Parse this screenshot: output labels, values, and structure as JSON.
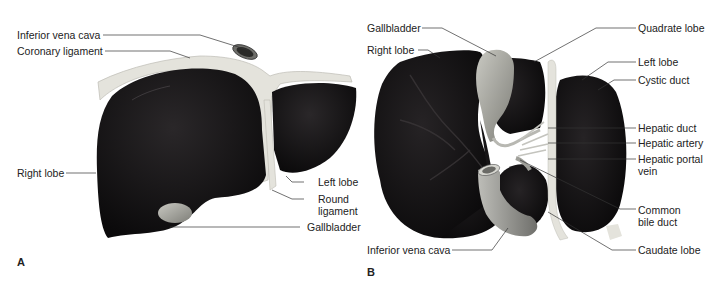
{
  "figure": {
    "panels": [
      {
        "id": "A",
        "letter": "A",
        "view": "anterior",
        "labels": {
          "inferior_vena_cava": "Inferior vena cava",
          "coronary_ligament": "Coronary ligament",
          "right_lobe": "Right lobe",
          "left_lobe": "Left lobe",
          "round_ligament_1": "Round",
          "round_ligament_2": "ligament",
          "gallbladder": "Gallbladder"
        }
      },
      {
        "id": "B",
        "letter": "B",
        "view": "inferior",
        "labels": {
          "gallbladder": "Gallbladder",
          "right_lobe": "Right lobe",
          "quadrate_lobe": "Quadrate lobe",
          "left_lobe": "Left lobe",
          "cystic_duct": "Cystic duct",
          "hepatic_duct": "Hepatic duct",
          "hepatic_artery": "Hepatic artery",
          "hepatic_portal_vein_1": "Hepatic portal",
          "hepatic_portal_vein_2": "vein",
          "common_bile_duct_1": "Common",
          "common_bile_duct_2": "bile duct",
          "inferior_vena_cava": "Inferior vena cava",
          "caudate_lobe": "Caudate lobe"
        }
      }
    ],
    "colors": {
      "liver": "#0f0d0f",
      "ligament": "#e4e3dc",
      "gallbladder": "#9a9a92",
      "vessel": "#8a8a86",
      "leader_line": "#333333",
      "text": "#222222"
    }
  }
}
